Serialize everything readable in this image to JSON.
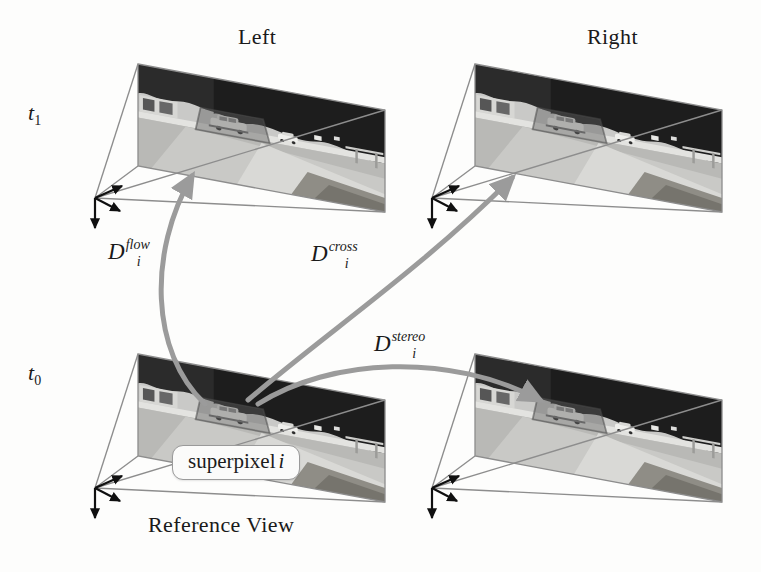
{
  "figure": {
    "kind": "multi-view-stereo-flow-diagram",
    "background_color": "#fdfdfc",
    "ink_color": "#1a1a1a",
    "frustum_color": "#8d8d8d",
    "curve_color": "#9b9b9b"
  },
  "column_titles": [
    {
      "text": "Left",
      "x": 238,
      "y": 24
    },
    {
      "text": "Right",
      "x": 587,
      "y": 24
    }
  ],
  "time_labels": [
    {
      "base": "t",
      "sub": "1",
      "x": 28,
      "y": 100
    },
    {
      "base": "t",
      "sub": "0",
      "x": 28,
      "y": 360
    }
  ],
  "bottom_caption": {
    "text": "Reference View",
    "x": 148,
    "y": 512
  },
  "superpixel_box": {
    "prefix": "superpixel",
    "index": "i",
    "x": 172,
    "y": 445
  },
  "distance_labels": [
    {
      "base": "D",
      "sup": "flow",
      "sub": "i",
      "x": 108,
      "y": 239
    },
    {
      "base": "D",
      "sup": "cross",
      "sub": "i",
      "x": 311,
      "y": 241
    },
    {
      "base": "D",
      "sup": "stereo",
      "sub": "i",
      "x": 374,
      "y": 331
    }
  ],
  "views": [
    {
      "name": "top-left-camera-view",
      "time": "t1",
      "side": "Left",
      "role": "source"
    },
    {
      "name": "top-right-camera-view",
      "time": "t1",
      "side": "Right",
      "role": "source"
    },
    {
      "name": "bottom-left-camera-view",
      "time": "t0",
      "side": "Left",
      "role": "reference"
    },
    {
      "name": "bottom-right-camera-view",
      "time": "t0",
      "side": "Right",
      "role": "target"
    }
  ],
  "scene_description": "Grayscale road scene: dark trees and foliage along the top, a light road surface with a white car at center-left and a second smaller vehicle to its right, a guard rail on the right, and a bright paved road sweeping to the lower right.",
  "correspondences": [
    {
      "label": "D_i^flow",
      "from": "bottom-left-camera-view",
      "to": "top-left-camera-view"
    },
    {
      "label": "D_i^cross",
      "from": "bottom-left-camera-view",
      "to": "top-right-camera-view"
    },
    {
      "label": "D_i^stereo",
      "from": "bottom-left-camera-view",
      "to": "bottom-right-camera-view"
    }
  ]
}
